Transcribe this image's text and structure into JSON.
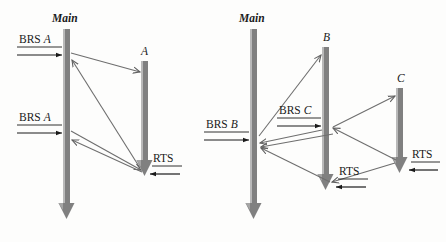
{
  "figure": {
    "type": "sequence-diagram-pair",
    "background_color": "#fdfdfc",
    "bar_color": "#808080",
    "bar_highlight_color": "#b9b9b9",
    "arrow_color": "#6e6e6e",
    "text_color": "#1a1a1a"
  },
  "diagrams": [
    {
      "id": "left",
      "lifelines": [
        {
          "label": "Main",
          "kind": "main"
        },
        {
          "label": "A",
          "kind": "actor"
        }
      ],
      "messages": [
        {
          "label": "BRS A",
          "from": "external",
          "to": "Main",
          "index": 1
        },
        {
          "label": "BRS A",
          "from": "external",
          "to": "Main",
          "index": 2
        },
        {
          "label": "RTS",
          "from": "external",
          "to": "A",
          "index": 3
        }
      ]
    },
    {
      "id": "right",
      "lifelines": [
        {
          "label": "Main",
          "kind": "main"
        },
        {
          "label": "B",
          "kind": "actor"
        },
        {
          "label": "C",
          "kind": "actor"
        }
      ],
      "messages": [
        {
          "label": "BRS B",
          "from": "external",
          "to": "Main",
          "index": 1
        },
        {
          "label": "BRS C",
          "from": "external",
          "to": "B",
          "index": 2
        },
        {
          "label": "RTS",
          "from": "external",
          "to": "B",
          "index": 3
        },
        {
          "label": "RTS",
          "from": "external",
          "to": "C",
          "index": 4
        }
      ]
    }
  ],
  "labels": {
    "left_main": "Main",
    "left_a": "A",
    "left_brs_a_top_prefix": "BRS ",
    "left_brs_a_top_name": "A",
    "left_brs_a_bottom_prefix": "BRS ",
    "left_brs_a_bottom_name": "A",
    "left_rts": "RTS",
    "right_main": "Main",
    "right_b": "B",
    "right_c": "C",
    "right_brs_b_prefix": "BRS ",
    "right_brs_b_name": "B",
    "right_brs_c_prefix": "BRS ",
    "right_brs_c_name": "C",
    "right_rts_b": "RTS",
    "right_rts_c": "RTS"
  }
}
